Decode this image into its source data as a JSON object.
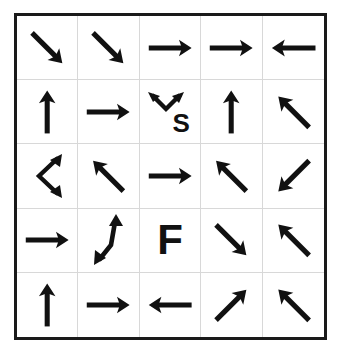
{
  "figure": {
    "rows": 5,
    "columns": 5,
    "border_color": "#1a1a1a",
    "gridline_color": "#d8d8d8",
    "background_color": "#ffffff",
    "arrow_color": "#111111"
  },
  "labels": {
    "start_marker": "S",
    "finish_marker": "F"
  },
  "cells": [
    {
      "row": 1,
      "col": 1,
      "icon": "arrow-down-right-icon",
      "type": "single",
      "direction": "down-right",
      "label": ""
    },
    {
      "row": 1,
      "col": 2,
      "icon": "arrow-down-right-icon",
      "type": "single",
      "direction": "down-right",
      "label": ""
    },
    {
      "row": 1,
      "col": 3,
      "icon": "arrow-right-icon",
      "type": "single",
      "direction": "right",
      "label": ""
    },
    {
      "row": 1,
      "col": 4,
      "icon": "arrow-right-icon",
      "type": "single",
      "direction": "right",
      "label": ""
    },
    {
      "row": 1,
      "col": 5,
      "icon": "arrow-left-icon",
      "type": "single",
      "direction": "left",
      "label": ""
    },
    {
      "row": 2,
      "col": 1,
      "icon": "arrow-up-icon",
      "type": "single",
      "direction": "up",
      "label": ""
    },
    {
      "row": 2,
      "col": 2,
      "icon": "arrow-right-icon",
      "type": "single",
      "direction": "right",
      "label": ""
    },
    {
      "row": 2,
      "col": 3,
      "icon": "double-arrow-v-icon",
      "type": "double-v",
      "direction": "up-left-and-up-right",
      "label": "S"
    },
    {
      "row": 2,
      "col": 4,
      "icon": "arrow-up-icon",
      "type": "single",
      "direction": "up",
      "label": ""
    },
    {
      "row": 2,
      "col": 5,
      "icon": "arrow-up-left-icon",
      "type": "single",
      "direction": "up-left",
      "label": ""
    },
    {
      "row": 3,
      "col": 1,
      "icon": "double-arrow-chevron-icon",
      "type": "double-chevron",
      "direction": "up-right-and-down-right",
      "label": ""
    },
    {
      "row": 3,
      "col": 2,
      "icon": "arrow-up-left-icon",
      "type": "single",
      "direction": "up-left",
      "label": ""
    },
    {
      "row": 3,
      "col": 3,
      "icon": "arrow-right-icon",
      "type": "single",
      "direction": "right",
      "label": ""
    },
    {
      "row": 3,
      "col": 4,
      "icon": "arrow-up-left-icon",
      "type": "single",
      "direction": "up-left",
      "label": ""
    },
    {
      "row": 3,
      "col": 5,
      "icon": "arrow-down-left-icon",
      "type": "single",
      "direction": "down-left",
      "label": ""
    },
    {
      "row": 4,
      "col": 1,
      "icon": "arrow-right-icon",
      "type": "single",
      "direction": "right",
      "label": ""
    },
    {
      "row": 4,
      "col": 2,
      "icon": "double-arrow-bent-icon",
      "type": "double-bent",
      "direction": "up-and-down-left",
      "label": ""
    },
    {
      "row": 4,
      "col": 3,
      "icon": "letter-f-marker",
      "type": "letter",
      "direction": "",
      "label": "F"
    },
    {
      "row": 4,
      "col": 4,
      "icon": "arrow-down-right-icon",
      "type": "single",
      "direction": "down-right",
      "label": ""
    },
    {
      "row": 4,
      "col": 5,
      "icon": "arrow-up-left-icon",
      "type": "single",
      "direction": "up-left",
      "label": ""
    },
    {
      "row": 5,
      "col": 1,
      "icon": "arrow-up-icon",
      "type": "single",
      "direction": "up",
      "label": ""
    },
    {
      "row": 5,
      "col": 2,
      "icon": "arrow-right-icon",
      "type": "single",
      "direction": "right",
      "label": ""
    },
    {
      "row": 5,
      "col": 3,
      "icon": "arrow-left-icon",
      "type": "single",
      "direction": "left",
      "label": ""
    },
    {
      "row": 5,
      "col": 4,
      "icon": "arrow-up-right-icon",
      "type": "single",
      "direction": "up-right",
      "label": ""
    },
    {
      "row": 5,
      "col": 5,
      "icon": "arrow-up-left-icon",
      "type": "single",
      "direction": "up-left",
      "label": ""
    }
  ]
}
